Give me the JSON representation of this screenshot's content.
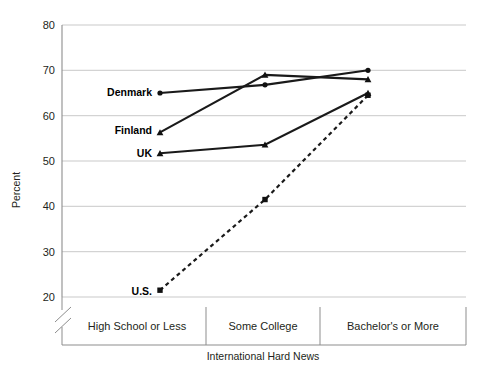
{
  "chart_data": {
    "type": "line",
    "title": "",
    "subtitle": "",
    "xlabel": "International Hard News",
    "ylabel": "Percent",
    "categories": [
      "High School or Less",
      "Some College",
      "Bachelor's or More"
    ],
    "ylim": [
      20,
      80
    ],
    "yticks": [
      20,
      30,
      40,
      50,
      60,
      70,
      80
    ],
    "ytick_labels": [
      "20",
      "30",
      "40",
      "50",
      "60",
      "70",
      "80"
    ],
    "grid": true,
    "axis_break": true,
    "legend": "inline-labels",
    "legend_position": "left-inline",
    "series": [
      {
        "name": "Denmark",
        "marker": "circle",
        "linestyle": "solid",
        "values": [
          65,
          66.8,
          70
        ]
      },
      {
        "name": "Finland",
        "marker": "triangle",
        "linestyle": "solid",
        "values": [
          56.3,
          69,
          68
        ]
      },
      {
        "name": "UK",
        "marker": "triangle",
        "linestyle": "solid",
        "values": [
          51.7,
          53.6,
          65
        ]
      },
      {
        "name": "U.S.",
        "marker": "square",
        "linestyle": "dashed",
        "values": [
          21.5,
          41.5,
          64.5
        ]
      }
    ]
  },
  "labels": {
    "denmark": "Denmark",
    "finland": "Finland",
    "uk": "UK",
    "us": "U.S.",
    "y_axis_title": "Percent",
    "x_axis_title": "International Hard News",
    "cat_1": "High School or Less",
    "cat_2": "Some College",
    "cat_3": "Bachelor's or More",
    "tick_80": "80",
    "tick_70": "70",
    "tick_60": "60",
    "tick_50": "50",
    "tick_40": "40",
    "tick_30": "30",
    "tick_20": "20"
  },
  "colors": {
    "line": "#1a1a1a",
    "grid": "#c9c9c9",
    "axis": "#8d8d8d",
    "text": "#231f20",
    "background": "#ffffff"
  }
}
